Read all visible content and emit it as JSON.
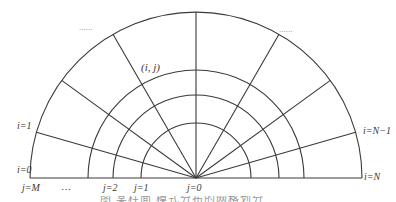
{
  "diagram": {
    "type": "polar-grid-semicircle",
    "center": {
      "x": 196,
      "y": 178
    },
    "radii": [
      55,
      83,
      108,
      166
    ],
    "radial_angles_deg": [
      16,
      36,
      60,
      90,
      120,
      144,
      164
    ],
    "stroke_color": "#3a3a3a",
    "ellipsis_color": "#8a8a8a"
  },
  "labels": {
    "cell": "(i, j)",
    "ellipsis_left": "......",
    "ellipsis_right": "......",
    "i_1": "i=1",
    "i_0": "i=0",
    "i_N_minus_1": "i=N−1",
    "i_N": "i=N",
    "j_M": "j=M",
    "j_dots": "…",
    "j_2": "j=2",
    "j_1": "j=1",
    "j_0": "j=0"
  },
  "caption": {
    "text": "图  某柱面  模式分布的网格划分",
    "note": "caption cropped at bottom edge, only tops of glyphs visible"
  }
}
